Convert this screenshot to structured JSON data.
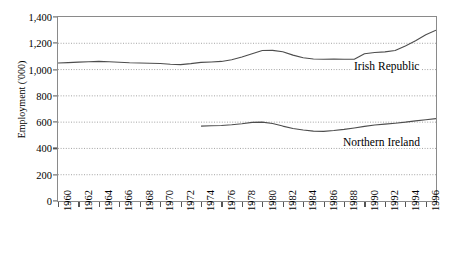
{
  "chart_data": {
    "type": "line",
    "title": "",
    "xlabel": "",
    "ylabel": "Employment ('000)",
    "ylim": [
      0,
      1400
    ],
    "ytick_labels": [
      "0",
      "200",
      "400",
      "600",
      "800",
      "1,000",
      "1,200",
      "1,400"
    ],
    "ytick_values": [
      0,
      200,
      400,
      600,
      800,
      1000,
      1200,
      1400
    ],
    "xlim": [
      1960,
      1997
    ],
    "xtick_labels": [
      "1960",
      "1962",
      "1964",
      "1966",
      "1968",
      "1970",
      "1972",
      "1974",
      "1976",
      "1978",
      "1980",
      "1982",
      "1984",
      "1986",
      "1988",
      "1990",
      "1992",
      "1994",
      "1996"
    ],
    "xtick_values": [
      1960,
      1962,
      1964,
      1966,
      1968,
      1970,
      1972,
      1974,
      1976,
      1978,
      1980,
      1982,
      1984,
      1986,
      1988,
      1990,
      1992,
      1994,
      1996
    ],
    "minor_xticks_every": 1,
    "grid": "horizontal-dotted",
    "legend_position": "inline-right",
    "series": [
      {
        "name": "Irish Republic",
        "color": "#4d4d4d",
        "x": [
          1960,
          1961,
          1962,
          1963,
          1964,
          1965,
          1966,
          1967,
          1968,
          1969,
          1970,
          1971,
          1972,
          1973,
          1974,
          1975,
          1976,
          1977,
          1978,
          1979,
          1980,
          1981,
          1982,
          1983,
          1984,
          1985,
          1986,
          1987,
          1988,
          1989,
          1990,
          1991,
          1992,
          1993,
          1994,
          1995,
          1996,
          1997
        ],
        "values": [
          1050,
          1053,
          1057,
          1060,
          1062,
          1060,
          1056,
          1052,
          1050,
          1048,
          1046,
          1040,
          1038,
          1045,
          1055,
          1058,
          1062,
          1075,
          1095,
          1120,
          1145,
          1146,
          1136,
          1110,
          1090,
          1080,
          1078,
          1080,
          1078,
          1078,
          1120,
          1130,
          1135,
          1145,
          1180,
          1220,
          1265,
          1300
        ]
      },
      {
        "name": "Northern Ireland",
        "color": "#4d4d4d",
        "x": [
          1974,
          1975,
          1976,
          1977,
          1978,
          1979,
          1980,
          1981,
          1982,
          1983,
          1984,
          1985,
          1986,
          1987,
          1988,
          1989,
          1990,
          1991,
          1992,
          1993,
          1994,
          1995,
          1996,
          1997
        ],
        "values": [
          570,
          572,
          575,
          580,
          588,
          598,
          600,
          590,
          570,
          552,
          540,
          532,
          530,
          536,
          545,
          556,
          568,
          578,
          585,
          592,
          600,
          610,
          618,
          627
        ]
      }
    ],
    "annotations": [
      {
        "text": "Irish Republic",
        "near_year": 1992,
        "near_value": 1075
      },
      {
        "text": "Northern Ireland",
        "near_year": 1990,
        "near_value": 505
      }
    ]
  }
}
